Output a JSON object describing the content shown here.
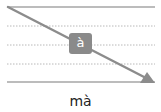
{
  "diagram": {
    "type": "tone-stroke-guide",
    "lines": {
      "solid": [
        "top",
        "bottom"
      ],
      "dotted": [
        "upper",
        "middle",
        "lower"
      ]
    },
    "arrow": {
      "direction": "top-left to bottom-right",
      "tone": "falling"
    },
    "badge_letter": "à",
    "colors": {
      "line": "#a6a6a6",
      "dotted": "#b8b8b8",
      "arrow": "#8c8c8c",
      "badge_bg": "#8a8a8a",
      "badge_text": "#ffffff"
    }
  },
  "caption": "mà"
}
